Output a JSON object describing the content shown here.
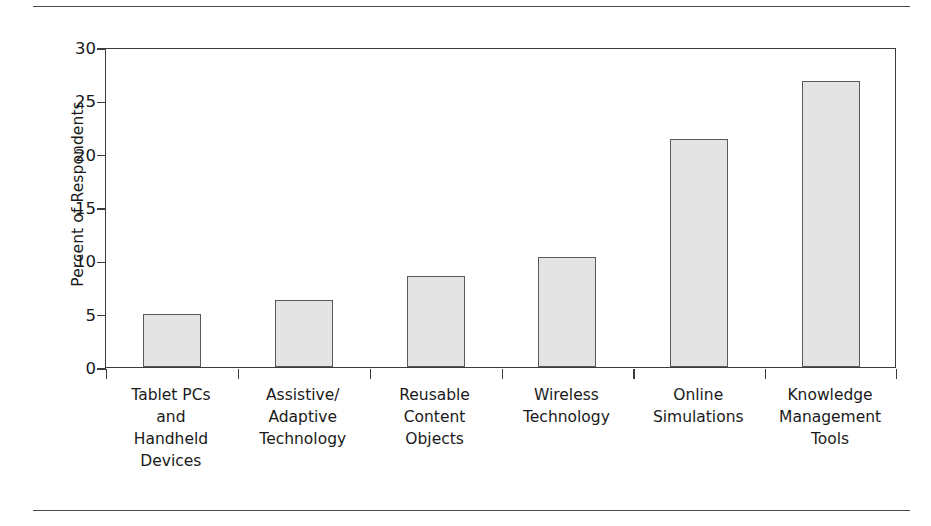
{
  "chart_data": {
    "type": "bar",
    "title": "",
    "xlabel": "",
    "ylabel": "Percent of Respondents",
    "ylim": [
      0,
      30
    ],
    "yticks": [
      0,
      5,
      10,
      15,
      20,
      25,
      30
    ],
    "ytick_labels": [
      "0",
      "5",
      "10",
      "15",
      "20",
      "25",
      "30"
    ],
    "grid": false,
    "legend": false,
    "categories": [
      "Tablet PCs\nand\nHandheld\nDevices",
      "Assistive/\nAdaptive\nTechnology",
      "Reusable\nContent\nObjects",
      "Wireless\nTechnology",
      "Online\nSimulations",
      "Knowledge\nManagement\nTools"
    ],
    "category_lines": [
      [
        "Tablet PCs",
        "and",
        "Handheld",
        "Devices"
      ],
      [
        "Assistive/",
        "Adaptive",
        "Technology"
      ],
      [
        "Reusable",
        "Content",
        "Objects"
      ],
      [
        "Wireless",
        "Technology"
      ],
      [
        "Online",
        "Simulations"
      ],
      [
        "Knowledge",
        "Management",
        "Tools"
      ]
    ],
    "values": [
      5.0,
      6.3,
      8.5,
      10.3,
      21.4,
      26.8
    ],
    "bar_fill": "#e4e4e4",
    "bar_edge": "#5a5a5a",
    "axis_color": "#3c3c3c"
  }
}
